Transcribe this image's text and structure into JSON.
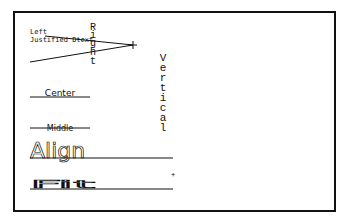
{
  "drawing": {
    "frame": {
      "x": 14,
      "y": 12,
      "width": 321,
      "height": 199,
      "stroke": "#111111"
    },
    "labels": {
      "left": "Left",
      "justified": "Justified Dtext",
      "right_chars": [
        "R",
        "i",
        "g",
        "h",
        "t"
      ],
      "vertical_chars": [
        "V",
        "e",
        "r",
        "t",
        "i",
        "c",
        "a",
        "l"
      ],
      "center": "Center",
      "middle": "Middle",
      "align": "Align",
      "fit": "Fit",
      "plus_marker": "+"
    },
    "colors": {
      "ink": "#111111",
      "background": "#ffffff"
    }
  }
}
